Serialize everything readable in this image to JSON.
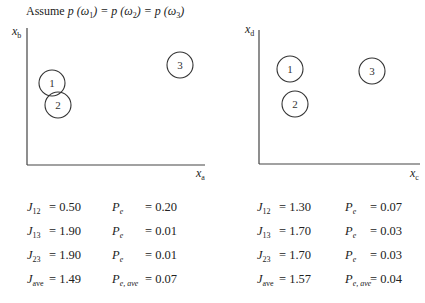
{
  "title": {
    "prefix": "Assume ",
    "p1": "p (ω",
    "s1": "1",
    "eq1": ") = p (ω",
    "s2": "2",
    "eq2": ") = p (ω",
    "s3": "3",
    "end": ")"
  },
  "left_plot": {
    "y_label": "x",
    "y_label_sub": "b",
    "x_label": "x",
    "x_label_sub": "a",
    "clusters": [
      {
        "label": "1",
        "cx": 52,
        "cy": 83
      },
      {
        "label": "2",
        "cx": 58,
        "cy": 105
      },
      {
        "label": "3",
        "cx": 180,
        "cy": 65
      }
    ]
  },
  "right_plot": {
    "y_label": "x",
    "y_label_sub": "d",
    "x_label": "x",
    "x_label_sub": "c",
    "clusters": [
      {
        "label": "1",
        "cx": 290,
        "cy": 69
      },
      {
        "label": "2",
        "cx": 295,
        "cy": 104
      },
      {
        "label": "3",
        "cx": 372,
        "cy": 71
      }
    ]
  },
  "left_table": [
    {
      "j": "J",
      "j_sub": "12",
      "j_val": "= 0.50",
      "p": "P",
      "p_sub": "e",
      "p_val": "= 0.20"
    },
    {
      "j": "J",
      "j_sub": "13",
      "j_val": "= 1.90",
      "p": "P",
      "p_sub": "e",
      "p_val": "= 0.01"
    },
    {
      "j": "J",
      "j_sub": "23",
      "j_val": "= 1.90",
      "p": "P",
      "p_sub": "e",
      "p_val": "= 0.01"
    },
    {
      "j": "J",
      "j_sub": "ave",
      "j_val": "= 1.49",
      "p": "P",
      "p_sub": "e, ave",
      "p_val": "= 0.07"
    }
  ],
  "right_table": [
    {
      "j": "J",
      "j_sub": "12",
      "j_val": "= 1.30",
      "p": "P",
      "p_sub": "e",
      "p_val": "= 0.07"
    },
    {
      "j": "J",
      "j_sub": "13",
      "j_val": "= 1.70",
      "p": "P",
      "p_sub": "e",
      "p_val": "= 0.03"
    },
    {
      "j": "J",
      "j_sub": "23",
      "j_val": "= 1.70",
      "p": "P",
      "p_sub": "e",
      "p_val": "= 0.03"
    },
    {
      "j": "J",
      "j_sub": "ave",
      "j_val": "= 1.57",
      "p": "P",
      "p_sub": "e, ave",
      "p_val": "= 0.04"
    }
  ]
}
